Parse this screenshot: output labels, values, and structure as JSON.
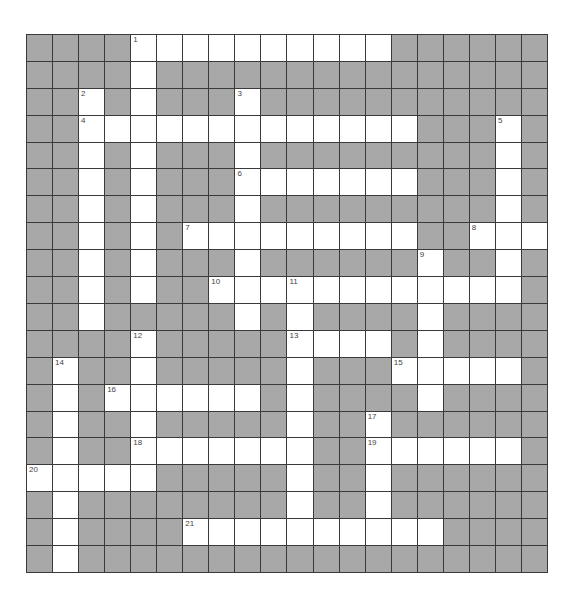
{
  "puzzle": {
    "rows": 20,
    "cols": 20,
    "colors": {
      "block": "#a8a8a8",
      "open": "#ffffff",
      "border": "#3a3a3a",
      "number": "#444444"
    },
    "open_cells": [
      [
        0,
        [
          4,
          5,
          6,
          7,
          8,
          9,
          10,
          11,
          12,
          13
        ]
      ],
      [
        1,
        [
          4
        ]
      ],
      [
        2,
        [
          2,
          4,
          8
        ]
      ],
      [
        3,
        [
          2,
          3,
          4,
          5,
          6,
          7,
          8,
          9,
          10,
          11,
          12,
          13,
          14,
          18
        ]
      ],
      [
        4,
        [
          2,
          4,
          8,
          18
        ]
      ],
      [
        5,
        [
          2,
          4,
          8,
          9,
          10,
          11,
          12,
          13,
          14,
          18
        ]
      ],
      [
        6,
        [
          2,
          4,
          8,
          18
        ]
      ],
      [
        7,
        [
          2,
          4,
          6,
          7,
          8,
          9,
          10,
          11,
          12,
          13,
          14,
          17,
          18,
          19
        ]
      ],
      [
        8,
        [
          2,
          4,
          8,
          15,
          18
        ]
      ],
      [
        9,
        [
          2,
          4,
          7,
          8,
          9,
          10,
          11,
          12,
          13,
          14,
          15,
          16,
          17,
          18
        ]
      ],
      [
        10,
        [
          2,
          8,
          10,
          15
        ]
      ],
      [
        11,
        [
          4,
          10,
          11,
          12,
          13,
          15
        ]
      ],
      [
        12,
        [
          1,
          4,
          10,
          14,
          15,
          16,
          17,
          18
        ]
      ],
      [
        13,
        [
          1,
          3,
          4,
          5,
          6,
          7,
          8,
          10,
          15
        ]
      ],
      [
        14,
        [
          1,
          4,
          10,
          13
        ]
      ],
      [
        15,
        [
          1,
          4,
          5,
          6,
          7,
          8,
          9,
          10,
          13,
          14,
          15,
          16,
          17,
          18
        ]
      ],
      [
        16,
        [
          0,
          1,
          2,
          3,
          4,
          10,
          13
        ]
      ],
      [
        17,
        [
          1,
          10,
          13
        ]
      ],
      [
        18,
        [
          1,
          6,
          7,
          8,
          9,
          10,
          11,
          12,
          13,
          14,
          15
        ]
      ],
      [
        19,
        [
          1
        ]
      ]
    ],
    "numbers": [
      {
        "n": "1",
        "r": 0,
        "c": 4
      },
      {
        "n": "2",
        "r": 2,
        "c": 2
      },
      {
        "n": "3",
        "r": 2,
        "c": 8
      },
      {
        "n": "4",
        "r": 3,
        "c": 2
      },
      {
        "n": "5",
        "r": 3,
        "c": 18
      },
      {
        "n": "6",
        "r": 5,
        "c": 8
      },
      {
        "n": "7",
        "r": 7,
        "c": 6
      },
      {
        "n": "8",
        "r": 7,
        "c": 17
      },
      {
        "n": "9",
        "r": 8,
        "c": 15
      },
      {
        "n": "10",
        "r": 9,
        "c": 7
      },
      {
        "n": "11",
        "r": 9,
        "c": 10
      },
      {
        "n": "12",
        "r": 11,
        "c": 4
      },
      {
        "n": "13",
        "r": 11,
        "c": 10
      },
      {
        "n": "14",
        "r": 12,
        "c": 1
      },
      {
        "n": "15",
        "r": 12,
        "c": 14
      },
      {
        "n": "16",
        "r": 13,
        "c": 3
      },
      {
        "n": "17",
        "r": 14,
        "c": 13
      },
      {
        "n": "18",
        "r": 15,
        "c": 4
      },
      {
        "n": "19",
        "r": 15,
        "c": 13
      },
      {
        "n": "20",
        "r": 16,
        "c": 0
      },
      {
        "n": "21",
        "r": 18,
        "c": 6
      }
    ]
  }
}
